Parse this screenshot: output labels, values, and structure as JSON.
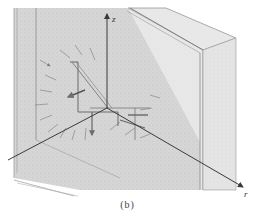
{
  "figure": {
    "caption": "(b)",
    "axes": {
      "z_label": "z",
      "r_label": "r"
    },
    "colors": {
      "background": "#ffffff",
      "panel_face": "#d4d4d4",
      "panel_side": "#e6e6e6",
      "floor": "#d0d0d0",
      "edge": "#8a8a8a",
      "axis": "#3a3a3a",
      "field_vector": "#6e6e6e"
    }
  }
}
